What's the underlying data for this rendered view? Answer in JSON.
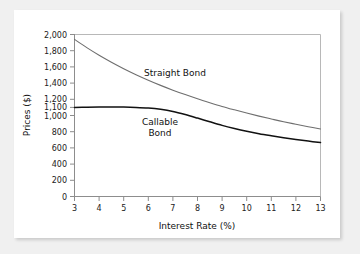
{
  "chart_data": {
    "type": "line",
    "title": "",
    "xlabel": "Interest Rate (%)",
    "ylabel": "Prices ($)",
    "xlim": [
      3,
      13
    ],
    "ylim": [
      0,
      2000
    ],
    "grid": false,
    "legend_position": "inline-annotations",
    "x_ticks": [
      3,
      4,
      5,
      6,
      7,
      8,
      9,
      10,
      11,
      12,
      13
    ],
    "x_tick_labels": [
      "3",
      "4",
      "5",
      "6",
      "7",
      "8",
      "9",
      "10",
      "11",
      "12",
      "13"
    ],
    "y_ticks": [
      0,
      200,
      400,
      600,
      800,
      1000,
      1100,
      1200,
      1400,
      1600,
      1800,
      2000
    ],
    "y_tick_labels": [
      "0",
      "200",
      "400",
      "600",
      "800",
      "1,000",
      "1,100",
      "1,200",
      "1,400",
      "1,600",
      "1,800",
      "2,000"
    ],
    "x": [
      3,
      3.5,
      4,
      4.5,
      5,
      5.5,
      6,
      6.5,
      7,
      7.5,
      8,
      8.5,
      9,
      9.5,
      10,
      10.5,
      11,
      11.5,
      12,
      12.5,
      13
    ],
    "series": [
      {
        "name": "Straight Bond",
        "color": "#6e6e6e",
        "values": [
          1940,
          1838,
          1744,
          1658,
          1578,
          1504,
          1436,
          1372,
          1313,
          1258,
          1206,
          1158,
          1112,
          1070,
          1030,
          992,
          957,
          923,
          892,
          862,
          834
        ]
      },
      {
        "name": "Callable Bond",
        "color": "#111111",
        "values": [
          1100,
          1102,
          1104,
          1105,
          1104,
          1100,
          1092,
          1076,
          1050,
          1012,
          968,
          922,
          878,
          840,
          806,
          776,
          750,
          726,
          704,
          684,
          666
        ]
      }
    ],
    "annotations": [
      {
        "text": "Straight Bond",
        "x": 7.1,
        "y": 1460
      },
      {
        "text": "Callable",
        "x": 6.45,
        "y": 880
      },
      {
        "text": "Bond",
        "x": 6.45,
        "y": 790
      }
    ]
  },
  "labels": {
    "straight_bond": "Straight Bond",
    "callable_line1": "Callable",
    "callable_line2": "Bond",
    "x_axis_title": "Interest Rate (%)",
    "y_axis_title": "Prices ($)"
  }
}
